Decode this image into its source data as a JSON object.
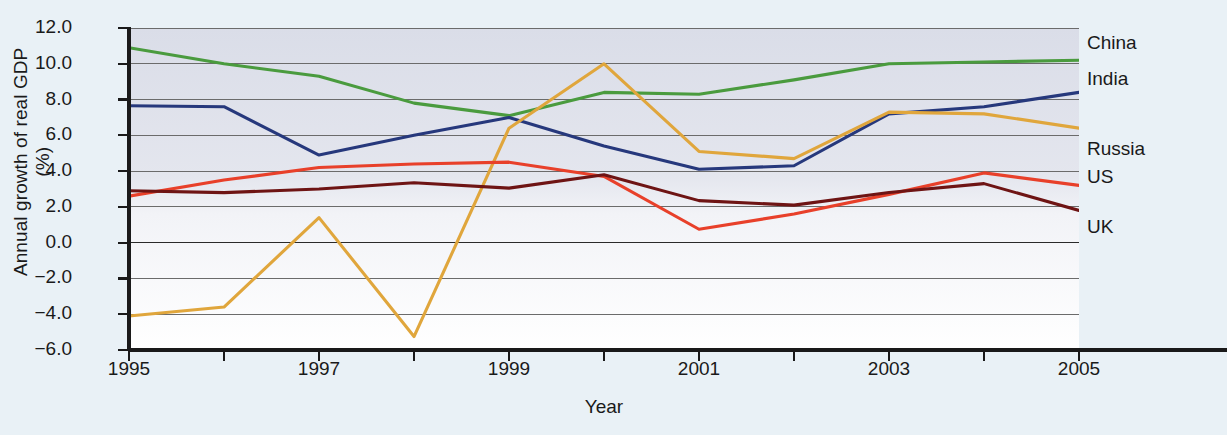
{
  "chart_data": {
    "type": "line",
    "title": "",
    "xlabel": "Year",
    "ylabel": "Annual growth of real GDP (%)",
    "ylabel_line1": "Annual growth of real GDP",
    "ylabel_line2": "(%)",
    "x": [
      1995,
      1996,
      1997,
      1998,
      1999,
      2000,
      2001,
      2002,
      2003,
      2004,
      2005
    ],
    "xlim": [
      1995,
      2005
    ],
    "ylim": [
      -6.0,
      12.0
    ],
    "grid": true,
    "legend_position": "right-inline",
    "xtick_labels": [
      "1995",
      "1997",
      "1999",
      "2001",
      "2003",
      "2005"
    ],
    "xtick_values": [
      1995,
      1997,
      1999,
      2001,
      2003,
      2005
    ],
    "xminor_tick_values": [
      1996,
      1998,
      2000,
      2002,
      2004
    ],
    "ytick_labels": [
      "12.0",
      "10.0",
      "8.0",
      "6.0",
      "4.0",
      "2.0",
      "0.0",
      "−2.0",
      "−4.0",
      "−6.0"
    ],
    "ytick_values": [
      12.0,
      10.0,
      8.0,
      6.0,
      4.0,
      2.0,
      0.0,
      -2.0,
      -4.0,
      -6.0
    ],
    "series": [
      {
        "name": "China",
        "color": "#4a9b3e",
        "label_y": 11.1,
        "values": [
          10.9,
          10.0,
          9.3,
          7.8,
          7.1,
          8.4,
          8.3,
          9.1,
          10.0,
          10.1,
          10.2
        ]
      },
      {
        "name": "India",
        "color": "#26387c",
        "label_y": 9.1,
        "values": [
          7.65,
          7.6,
          4.9,
          6.0,
          7.0,
          5.4,
          4.1,
          4.3,
          7.2,
          7.6,
          8.4
        ]
      },
      {
        "name": "Russia",
        "color": "#e0a63c",
        "label_y": 5.2,
        "values": [
          -4.1,
          -3.6,
          1.4,
          -5.25,
          6.4,
          10.0,
          5.1,
          4.7,
          7.3,
          7.2,
          6.4
        ]
      },
      {
        "name": "US",
        "color": "#e8402a",
        "label_y": 3.6,
        "values": [
          2.6,
          3.5,
          4.2,
          4.4,
          4.5,
          3.7,
          0.75,
          1.6,
          2.7,
          3.9,
          3.2
        ]
      },
      {
        "name": "UK",
        "color": "#6e1414",
        "label_y": 0.8,
        "values": [
          2.9,
          2.8,
          3.0,
          3.35,
          3.05,
          3.8,
          2.35,
          2.1,
          2.8,
          3.3,
          1.8
        ]
      }
    ]
  },
  "axis": {
    "y_title_l1": "Annual growth of real GDP",
    "y_title_l2": "(%)",
    "x_title": "Year"
  },
  "colors": {
    "page_background": "#e9f1f6",
    "plot_top": "#dcdfe9",
    "plot_bottom": "#ffffff",
    "axis_line": "#1a1a1a",
    "gridline": "#6b6b6b",
    "zero_line": "#2a2a2a"
  }
}
